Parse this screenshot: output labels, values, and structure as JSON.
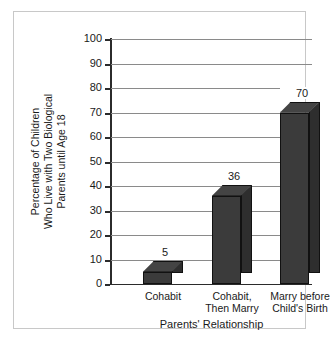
{
  "chart_data": {
    "type": "bar",
    "title": "",
    "subtitle": "",
    "categories": [
      "Cohabit",
      "Cohabit,\nThen Marry",
      "Marry before\nChild's Birth"
    ],
    "category_lines": [
      [
        "Cohabit"
      ],
      [
        "Cohabit,",
        "Then Marry"
      ],
      [
        "Marry before",
        "Child's Birth"
      ]
    ],
    "values": [
      5,
      36,
      70
    ],
    "value_labels": [
      "5",
      "36",
      "70"
    ],
    "xlabel": "Parents' Relationship",
    "ylabel": "Percentage of Children Who Live with Two Biological Parents until Age 18",
    "ylabel_lines": [
      "Percentage of Children",
      "Who Live with Two Biological",
      "Parents until Age 18"
    ],
    "ylim": [
      0,
      100
    ],
    "ytick_step": 10,
    "yticks": [
      0,
      10,
      20,
      30,
      40,
      50,
      60,
      70,
      80,
      90,
      100
    ],
    "ytick_labels": [
      "0",
      "10",
      "20",
      "30",
      "40",
      "50",
      "60",
      "70",
      "80",
      "90",
      "100"
    ],
    "grid": true,
    "grid_axis": "y",
    "legend": false,
    "legend_position": "none",
    "style": "3d-bar",
    "colors": {
      "bar_front": "#3b3b3b",
      "bar_side": "#2e2e2e",
      "bar_top": "#444444",
      "bar_edge": "#111111",
      "gridline": "#8a8a8a",
      "axis": "#2b2b2b",
      "frame": "#c8c8c8",
      "background": "#ffffff",
      "text": "#1a1a1a"
    }
  }
}
